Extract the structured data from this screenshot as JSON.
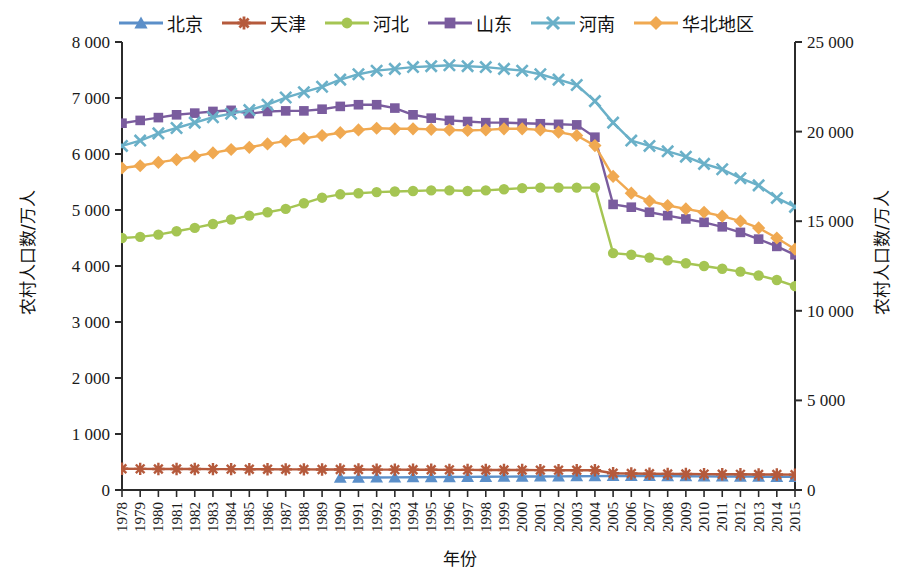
{
  "chart_data": {
    "type": "line",
    "title": "",
    "xlabel": "年份",
    "ylabel": "农村人口数/万人",
    "ylabel_right": "农村人口数/万人",
    "grid": false,
    "legend_position": "top",
    "x": [
      1978,
      1979,
      1980,
      1981,
      1982,
      1983,
      1984,
      1985,
      1986,
      1987,
      1988,
      1989,
      1990,
      1991,
      1992,
      1993,
      1994,
      1995,
      1996,
      1997,
      1998,
      1999,
      2000,
      2001,
      2002,
      2003,
      2004,
      2005,
      2006,
      2007,
      2008,
      2009,
      2010,
      2011,
      2012,
      2013,
      2014,
      2015
    ],
    "x_tick_labels": [
      "1978",
      "1979",
      "1980",
      "1981",
      "1982",
      "1983",
      "1984",
      "1985",
      "1986",
      "1987",
      "1988",
      "1989",
      "1990",
      "1991",
      "1992",
      "1993",
      "1994",
      "1995",
      "1996",
      "1997",
      "1998",
      "1999",
      "2000",
      "2001",
      "2002",
      "2003",
      "2004",
      "2005",
      "2006",
      "2007",
      "2008",
      "2009",
      "2010",
      "2011",
      "2012",
      "2013",
      "2014",
      "2015"
    ],
    "y_left": {
      "min": 0,
      "max": 8000,
      "step": 1000,
      "ticks": [
        0,
        1000,
        2000,
        3000,
        4000,
        5000,
        6000,
        7000,
        8000
      ],
      "tick_labels": [
        "0",
        "1 000",
        "2 000",
        "3 000",
        "4 000",
        "5 000",
        "6 000",
        "7 000",
        "8 000"
      ]
    },
    "y_right": {
      "min": 0,
      "max": 25000,
      "step": 5000,
      "ticks": [
        0,
        5000,
        10000,
        15000,
        20000,
        25000
      ],
      "tick_labels": [
        "0",
        "5 000",
        "10 000",
        "15 000",
        "20 000",
        "25 000"
      ]
    },
    "series": [
      {
        "name": "北京",
        "axis": "left",
        "color": "#5b8fc9",
        "marker": "triangle",
        "values": [
          null,
          null,
          null,
          null,
          null,
          null,
          null,
          null,
          null,
          null,
          null,
          null,
          220,
          222,
          224,
          226,
          228,
          230,
          232,
          234,
          236,
          238,
          240,
          242,
          244,
          246,
          248,
          250,
          250,
          250,
          248,
          246,
          244,
          242,
          240,
          238,
          236,
          234
        ]
      },
      {
        "name": "天津",
        "axis": "left",
        "color": "#b55a3c",
        "marker": "asterisk",
        "values": [
          380,
          378,
          376,
          375,
          374,
          373,
          372,
          371,
          370,
          369,
          368,
          367,
          366,
          365,
          364,
          363,
          362,
          361,
          360,
          359,
          358,
          357,
          356,
          355,
          354,
          353,
          352,
          300,
          295,
          290,
          288,
          286,
          284,
          282,
          280,
          278,
          276,
          274
        ]
      },
      {
        "name": "河北",
        "axis": "left",
        "color": "#a5c553",
        "marker": "circle",
        "values": [
          4500,
          4520,
          4560,
          4620,
          4680,
          4750,
          4830,
          4900,
          4960,
          5020,
          5120,
          5220,
          5280,
          5300,
          5320,
          5330,
          5340,
          5350,
          5350,
          5340,
          5350,
          5370,
          5390,
          5400,
          5400,
          5400,
          5400,
          4230,
          4200,
          4150,
          4100,
          4050,
          4000,
          3950,
          3900,
          3830,
          3750,
          3640
        ]
      },
      {
        "name": "山东",
        "axis": "left",
        "color": "#7a5c9e",
        "marker": "square",
        "values": [
          6550,
          6600,
          6650,
          6700,
          6730,
          6760,
          6780,
          6720,
          6760,
          6770,
          6770,
          6800,
          6850,
          6880,
          6880,
          6820,
          6700,
          6640,
          6600,
          6580,
          6560,
          6560,
          6550,
          6540,
          6530,
          6520,
          6300,
          5100,
          5050,
          4960,
          4900,
          4840,
          4780,
          4700,
          4600,
          4480,
          4350,
          4200
        ]
      },
      {
        "name": "河南",
        "axis": "right",
        "color": "#6ab0c8",
        "marker": "x",
        "values": [
          19200,
          19500,
          19900,
          20200,
          20500,
          20800,
          21000,
          21200,
          21500,
          21900,
          22200,
          22500,
          22900,
          23200,
          23400,
          23500,
          23600,
          23650,
          23700,
          23650,
          23600,
          23500,
          23400,
          23200,
          22900,
          22600,
          21700,
          20500,
          19500,
          19200,
          18900,
          18600,
          18200,
          17900,
          17400,
          17000,
          16300,
          15800
        ]
      },
      {
        "name": "华北地区",
        "axis": "left",
        "color": "#f0a951",
        "marker": "diamond",
        "values": [
          5750,
          5790,
          5850,
          5900,
          5960,
          6020,
          6080,
          6120,
          6180,
          6230,
          6280,
          6330,
          6380,
          6430,
          6460,
          6450,
          6450,
          6440,
          6430,
          6420,
          6430,
          6450,
          6450,
          6430,
          6390,
          6330,
          6150,
          5600,
          5300,
          5160,
          5080,
          5020,
          4960,
          4890,
          4800,
          4680,
          4500,
          4300
        ]
      }
    ]
  },
  "legend": {
    "items": [
      {
        "label": "北京"
      },
      {
        "label": "天津"
      },
      {
        "label": "河北"
      },
      {
        "label": "山东"
      },
      {
        "label": "河南"
      },
      {
        "label": "华北地区"
      }
    ]
  }
}
